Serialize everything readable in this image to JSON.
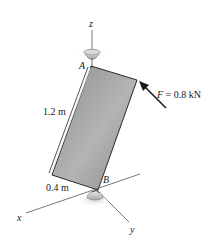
{
  "diagram": {
    "type": "statics-3d-plate",
    "labels": {
      "z_axis": "z",
      "x_axis": "x",
      "y_axis": "y",
      "point_a": "A",
      "point_b": "B",
      "force_symbol": "F",
      "force_eq": " = 0.8 kN",
      "height_dim": "1.2 m",
      "width_dim": "0.4 m"
    },
    "colors": {
      "plate_fill": "#9a9a9a",
      "plate_edge": "#2a2a2a",
      "axis": "#555555",
      "arrow": "#1a1a1a",
      "bearing": "#c8c8c8",
      "shadow": "#d6d6d6"
    }
  }
}
